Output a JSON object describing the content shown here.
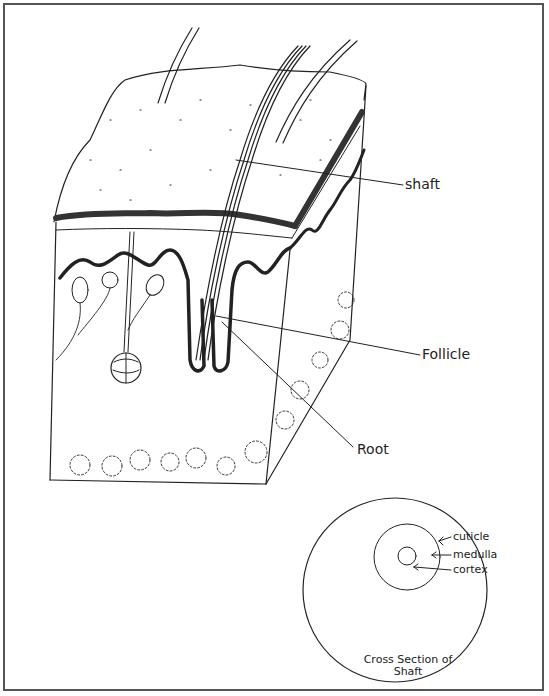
{
  "diagram": {
    "labels": {
      "shaft": "shaft",
      "follicle": "Follicle",
      "root": "Root"
    },
    "cross_section": {
      "caption_line1": "Cross Section of",
      "caption_line2": "Shaft",
      "labels": {
        "cuticle": "cuticle",
        "medulla": "medulla",
        "cortex": "cortex"
      }
    },
    "colors": {
      "ink": "#222222",
      "border": "#555555",
      "background": "#ffffff"
    }
  }
}
